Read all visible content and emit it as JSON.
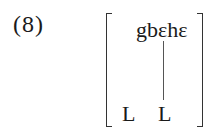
{
  "example": {
    "number": "(8)",
    "word": "gbɛhɛ",
    "tones": [
      "L",
      "L"
    ],
    "association_lines": [
      {
        "from_tone_index": 1,
        "to": "word"
      }
    ]
  }
}
